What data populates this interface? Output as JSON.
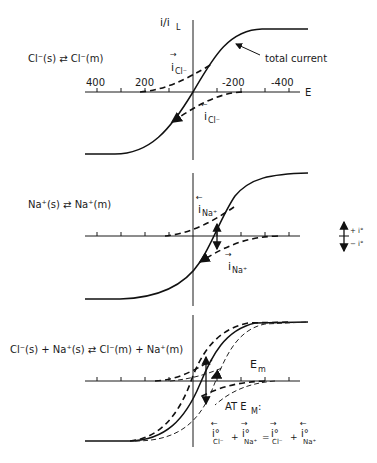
{
  "figure": {
    "y_axis_label": "i/i",
    "y_axis_label_sub": "L",
    "x_axis_label": "E",
    "x_ticks": [
      "400",
      "200",
      "-200",
      "-400"
    ],
    "panels": [
      {
        "id": "chloride",
        "reaction": "Cl⁻(s) ⇄ Cl⁻(m)",
        "curve_labels": {
          "anodic": "i",
          "anodic_sub": "Cl⁻",
          "cathodic": "i",
          "cathodic_sub": "Cl⁻"
        },
        "annotation": "total current"
      },
      {
        "id": "sodium",
        "reaction": "Na⁺(s) ⇄ Na⁺(m)",
        "curve_labels": {
          "anodic": "i",
          "anodic_sub": "Na⁺",
          "cathodic": "i",
          "cathodic_sub": "Na⁺"
        }
      },
      {
        "id": "combined",
        "reaction": "Cl⁻(s) + Na⁺(s) ⇄ Cl⁻(m) + Na⁺(m)",
        "potential_label": "E",
        "potential_sub": "m",
        "condition": "AT E",
        "condition_sub": "M",
        "condition_colon": ":",
        "equation": {
          "terms": [
            {
              "symbol": "i°",
              "sub": "Cl⁻",
              "arrow": "←"
            },
            {
              "symbol": "i°",
              "sub": "Na⁺",
              "arrow": "→"
            },
            {
              "symbol": "i°",
              "sub": "Cl⁻",
              "arrow": "→"
            },
            {
              "symbol": "i°",
              "sub": "Na⁺",
              "arrow": "←"
            }
          ],
          "op1": "+",
          "eq": "=",
          "op2": "+"
        }
      }
    ],
    "legend": {
      "plus": "+ i°",
      "minus": "− i°"
    }
  }
}
